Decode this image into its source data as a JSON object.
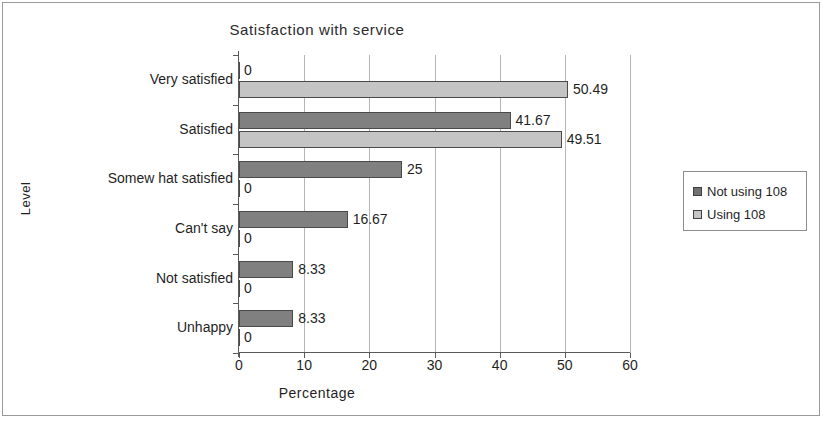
{
  "chart_data": {
    "type": "bar",
    "orientation": "horizontal",
    "title": "Satisfaction with service",
    "xlabel": "Percentage",
    "ylabel": "Level",
    "categories": [
      "Very satisfied",
      "Satisfied",
      "Somew hat satisfied",
      "Can't say",
      "Not satisfied",
      "Unhappy"
    ],
    "series": [
      {
        "name": "Not using 108",
        "color": "#808080",
        "values": [
          0,
          41.67,
          25,
          16.67,
          8.33,
          8.33
        ],
        "labels": [
          "0",
          "41.67",
          "25",
          "16.67",
          "8.33",
          "8.33"
        ]
      },
      {
        "name": "Using 108",
        "color": "#c4c4c4",
        "values": [
          50.49,
          49.51,
          0,
          0,
          0,
          0
        ],
        "labels": [
          "50.49",
          "49.51",
          "0",
          "0",
          "0",
          "0"
        ]
      }
    ],
    "xlim": [
      0,
      60
    ],
    "xticks": [
      0,
      10,
      20,
      30,
      40,
      50,
      60
    ],
    "xtick_labels": [
      "0",
      "10",
      "20",
      "30",
      "40",
      "50",
      "60"
    ],
    "grid": "vertical",
    "legend_position": "right"
  },
  "legend": {
    "items": [
      {
        "label": "Not using 108",
        "swatch": "dark"
      },
      {
        "label": "Using 108",
        "swatch": "light"
      }
    ]
  }
}
